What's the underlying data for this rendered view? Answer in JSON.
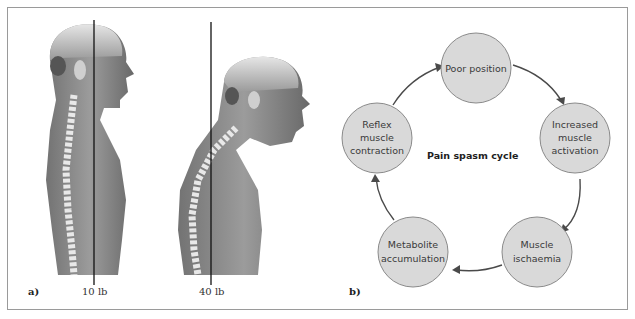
{
  "panel_a": {
    "label": "a)",
    "figures": [
      {
        "name": "upright-posture",
        "weight_label": "10 lb"
      },
      {
        "name": "forward-head-posture",
        "weight_label": "40 lb"
      }
    ]
  },
  "panel_b": {
    "label": "b)",
    "title": "Pain spasm cycle",
    "nodes": [
      {
        "lines": [
          "Poor position"
        ]
      },
      {
        "lines": [
          "Increased",
          "muscle",
          "activation"
        ]
      },
      {
        "lines": [
          "Muscle",
          "ischaemia"
        ]
      },
      {
        "lines": [
          "Metabolite",
          "accumulation"
        ]
      },
      {
        "lines": [
          "Reflex",
          "muscle",
          "contraction"
        ]
      }
    ],
    "colors": {
      "node_fill": "#d9d9d9",
      "node_stroke": "#8a8a8a",
      "arrow": "#4a4a4a"
    }
  }
}
